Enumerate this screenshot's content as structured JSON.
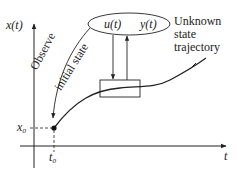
{
  "diagram": {
    "axes": {
      "y_label": "x(t)",
      "x_label": "t"
    },
    "initial_point": {
      "x_label": "x₀",
      "t_label": "t₀"
    },
    "ellipse": {
      "input_label": "u(t)",
      "output_label": "y(t)"
    },
    "annotations": {
      "observe_line1": "Observe",
      "observe_line2": "initial state",
      "trajectory_line1": "Unknown",
      "trajectory_line2": "state",
      "trajectory_line3": "trajectory"
    },
    "colors": {
      "ink": "#222222",
      "background": "#ffffff"
    }
  }
}
